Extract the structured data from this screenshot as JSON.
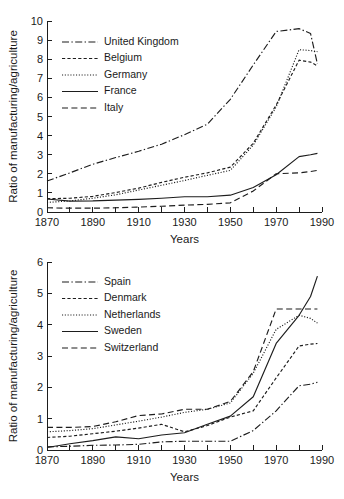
{
  "figure": {
    "charts": [
      {
        "id": "chart-top",
        "type": "line",
        "title": "",
        "xlabel": "Years",
        "ylabel": "Ratio of manufacturing/agriculture",
        "xlim": [
          1870,
          1990
        ],
        "ylim": [
          0,
          10
        ],
        "xticks": [
          1870,
          1880,
          1890,
          1900,
          1910,
          1920,
          1930,
          1940,
          1950,
          1960,
          1970,
          1980,
          1990
        ],
        "xticklabels": [
          "1870",
          "",
          "1890",
          "",
          "1910",
          "",
          "1930",
          "",
          "1950",
          "",
          "1970",
          "",
          "1990"
        ],
        "yticks": [
          0,
          1,
          2,
          3,
          4,
          5,
          6,
          7,
          8,
          9,
          10
        ],
        "yticklabels": [
          "0",
          "1",
          "2",
          "3",
          "4",
          "5",
          "6",
          "7",
          "8",
          "9",
          "10"
        ],
        "grid": false,
        "legend_position": "upper-left",
        "series": [
          {
            "name": "United Kingdom",
            "linestyle": "dashdot",
            "x": [
              1870,
              1880,
              1890,
              1900,
              1910,
              1920,
              1930,
              1940,
              1950,
              1960,
              1970,
              1980,
              1985,
              1988
            ],
            "values": [
              1.62,
              2.05,
              2.5,
              2.85,
              3.18,
              3.55,
              4.05,
              4.6,
              5.9,
              7.7,
              9.45,
              9.6,
              9.35,
              7.75
            ]
          },
          {
            "name": "Belgium",
            "linestyle": "dashed",
            "x": [
              1870,
              1880,
              1890,
              1900,
              1910,
              1920,
              1930,
              1940,
              1950,
              1960,
              1970,
              1980,
              1985,
              1988
            ],
            "values": [
              0.7,
              0.72,
              0.82,
              1.02,
              1.25,
              1.55,
              1.82,
              2.05,
              2.35,
              3.6,
              5.6,
              7.95,
              7.85,
              7.65
            ]
          },
          {
            "name": "Germany",
            "linestyle": "dotted",
            "x": [
              1870,
              1880,
              1890,
              1900,
              1910,
              1920,
              1930,
              1940,
              1950,
              1960,
              1970,
              1980,
              1985,
              1988
            ],
            "values": [
              0.5,
              0.58,
              0.72,
              0.9,
              1.15,
              1.4,
              1.65,
              1.92,
              2.18,
              3.5,
              5.5,
              8.5,
              8.45,
              8.4
            ]
          },
          {
            "name": "France",
            "linestyle": "solid",
            "x": [
              1870,
              1880,
              1890,
              1900,
              1910,
              1920,
              1930,
              1940,
              1950,
              1960,
              1970,
              1980,
              1985,
              1988
            ],
            "values": [
              0.68,
              0.57,
              0.58,
              0.62,
              0.66,
              0.72,
              0.8,
              0.8,
              0.88,
              1.28,
              1.95,
              2.9,
              3.0,
              3.07
            ]
          },
          {
            "name": "Italy",
            "linestyle": "longdash",
            "x": [
              1870,
              1880,
              1890,
              1900,
              1910,
              1920,
              1930,
              1940,
              1950,
              1960,
              1970,
              1980,
              1985,
              1988
            ],
            "values": [
              0.22,
              0.2,
              0.2,
              0.22,
              0.26,
              0.3,
              0.36,
              0.4,
              0.48,
              1.1,
              2.0,
              2.05,
              2.12,
              2.18
            ]
          }
        ]
      },
      {
        "id": "chart-bottom",
        "type": "line",
        "title": "",
        "xlabel": "Years",
        "ylabel": "Ratio of manufacturing/agriculture",
        "xlim": [
          1870,
          1990
        ],
        "ylim": [
          0,
          6
        ],
        "xticks": [
          1870,
          1880,
          1890,
          1900,
          1910,
          1920,
          1930,
          1940,
          1950,
          1960,
          1970,
          1980,
          1990
        ],
        "xticklabels": [
          "1870",
          "",
          "1890",
          "",
          "1910",
          "",
          "1930",
          "",
          "1950",
          "",
          "1970",
          "",
          "1990"
        ],
        "yticks": [
          0,
          1,
          2,
          3,
          4,
          5,
          6
        ],
        "yticklabels": [
          "0",
          "1",
          "2",
          "3",
          "4",
          "5",
          "6"
        ],
        "grid": false,
        "legend_position": "upper-left",
        "series": [
          {
            "name": "Spain",
            "linestyle": "dashdot",
            "x": [
              1870,
              1880,
              1890,
              1900,
              1910,
              1920,
              1930,
              1940,
              1950,
              1960,
              1970,
              1980,
              1985,
              1988
            ],
            "values": [
              0.1,
              0.12,
              0.15,
              0.16,
              0.18,
              0.26,
              0.28,
              0.28,
              0.28,
              0.62,
              1.25,
              2.05,
              2.1,
              2.16
            ]
          },
          {
            "name": "Denmark",
            "linestyle": "dashed",
            "x": [
              1870,
              1880,
              1890,
              1900,
              1910,
              1920,
              1930,
              1940,
              1950,
              1960,
              1970,
              1980,
              1985,
              1988
            ],
            "values": [
              0.4,
              0.44,
              0.52,
              0.6,
              0.7,
              0.82,
              0.58,
              0.78,
              1.05,
              1.25,
              2.3,
              3.32,
              3.38,
              3.4
            ]
          },
          {
            "name": "Netherlands",
            "linestyle": "dotted",
            "x": [
              1870,
              1880,
              1890,
              1900,
              1910,
              1920,
              1930,
              1940,
              1950,
              1960,
              1970,
              1980,
              1985,
              1988
            ],
            "values": [
              0.58,
              0.62,
              0.68,
              0.8,
              0.92,
              1.05,
              1.2,
              1.3,
              1.5,
              2.45,
              3.85,
              4.3,
              4.2,
              4.05
            ]
          },
          {
            "name": "Sweden",
            "linestyle": "solid",
            "x": [
              1870,
              1880,
              1890,
              1900,
              1910,
              1920,
              1930,
              1940,
              1950,
              1960,
              1970,
              1980,
              1985,
              1988
            ],
            "values": [
              0.08,
              0.2,
              0.3,
              0.42,
              0.36,
              0.48,
              0.55,
              0.82,
              1.08,
              1.7,
              3.4,
              4.3,
              4.9,
              5.55
            ]
          },
          {
            "name": "Switzerland",
            "linestyle": "longdash",
            "x": [
              1870,
              1880,
              1890,
              1900,
              1910,
              1920,
              1930,
              1940,
              1950,
              1960,
              1970,
              1980,
              1985,
              1988
            ],
            "values": [
              0.72,
              0.72,
              0.75,
              0.9,
              1.1,
              1.15,
              1.3,
              1.3,
              1.55,
              2.5,
              4.5,
              4.5,
              4.5,
              4.5
            ]
          }
        ]
      }
    ]
  }
}
